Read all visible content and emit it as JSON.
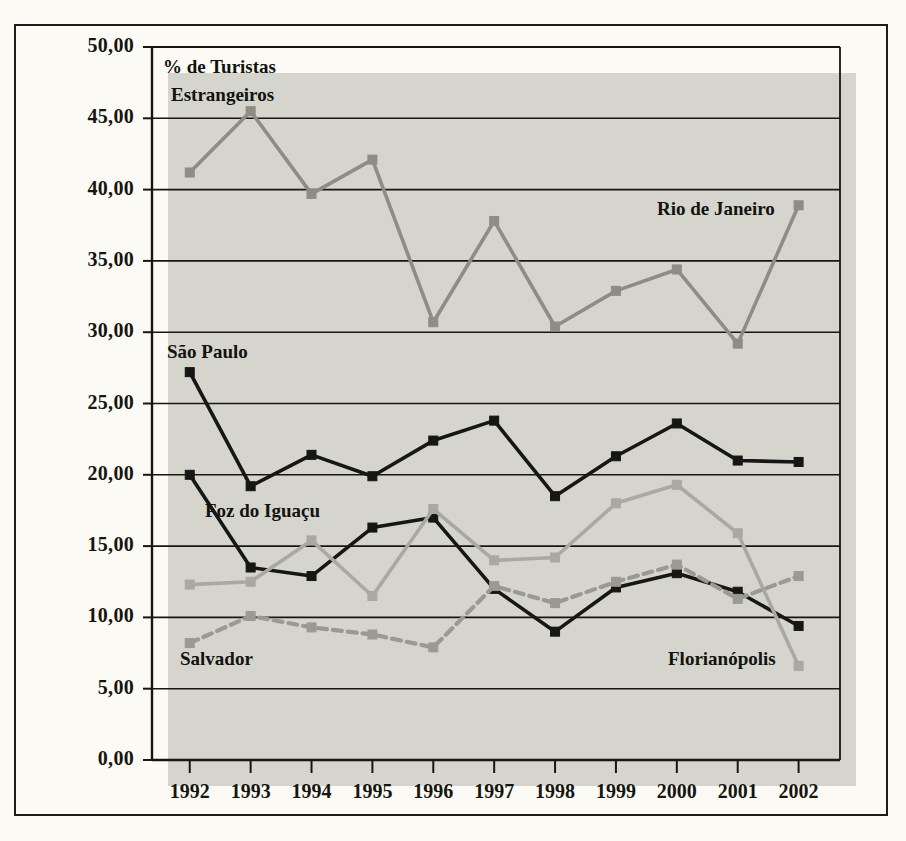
{
  "figure": {
    "background_color": "#fbfaf4",
    "plot_background_color": "#d5d5cd",
    "frame_color": "#1c1c1a"
  },
  "axis_title": {
    "line1": "% de Turistas",
    "line2": "Estrangeiros"
  },
  "labels": {
    "sao_paulo": "São Paulo",
    "foz_do_iguacu": "Foz do Iguaçu",
    "salvador": "Salvador",
    "rio_de_janeiro": "Rio de Janeiro",
    "florianopolis": "Florianópolis"
  },
  "chart_data": {
    "type": "line",
    "title": "% de Turistas Estrangeiros",
    "xlabel": "",
    "ylabel": "% de Turistas Estrangeiros",
    "ylim": [
      0,
      50
    ],
    "ytick_step": 5,
    "grid": true,
    "legend_position": "inline-annotations",
    "decimal_separator": ",",
    "x": [
      "1992",
      "1993",
      "1994",
      "1995",
      "1996",
      "1997",
      "1998",
      "1999",
      "2000",
      "2001",
      "2002"
    ],
    "categories": [
      "1992",
      "1993",
      "1994",
      "1995",
      "1996",
      "1997",
      "1998",
      "1999",
      "2000",
      "2001",
      "2002"
    ],
    "ytick_labels": [
      "50,00",
      "45,00",
      "40,00",
      "35,00",
      "30,00",
      "25,00",
      "20,00",
      "15,00",
      "10,00",
      "5,00",
      "0,00"
    ],
    "ytick_values": [
      50,
      45,
      40,
      35,
      30,
      25,
      20,
      15,
      10,
      5,
      0
    ],
    "series": [
      {
        "name": "Rio de Janeiro",
        "color": "#8d8d85",
        "style": "solid",
        "marker": "square",
        "values": [
          41.2,
          45.5,
          39.7,
          42.1,
          30.7,
          37.8,
          30.4,
          32.9,
          34.4,
          29.2,
          38.9
        ]
      },
      {
        "name": "São Paulo",
        "color": "#161614",
        "style": "solid",
        "marker": "square",
        "values": [
          27.2,
          19.2,
          21.4,
          19.9,
          22.4,
          23.8,
          18.5,
          21.3,
          23.6,
          21.0,
          20.9
        ]
      },
      {
        "name": "Foz do Iguaçu",
        "color": "#161614",
        "style": "solid",
        "marker": "square",
        "values": [
          20.0,
          13.5,
          12.9,
          16.3,
          17.0,
          12.0,
          9.0,
          12.1,
          13.1,
          11.8,
          9.4
        ]
      },
      {
        "name": "Florianópolis",
        "color": "#a9a9a1",
        "style": "solid",
        "marker": "square",
        "values": [
          12.3,
          12.5,
          15.4,
          11.5,
          17.6,
          14.0,
          14.2,
          18.0,
          19.3,
          15.9,
          6.6
        ]
      },
      {
        "name": "Salvador",
        "color": "#9a9a92",
        "style": "dashed",
        "marker": "square",
        "values": [
          8.2,
          10.1,
          9.3,
          8.8,
          7.9,
          12.2,
          11.0,
          12.5,
          13.7,
          11.3,
          12.9
        ]
      }
    ]
  }
}
